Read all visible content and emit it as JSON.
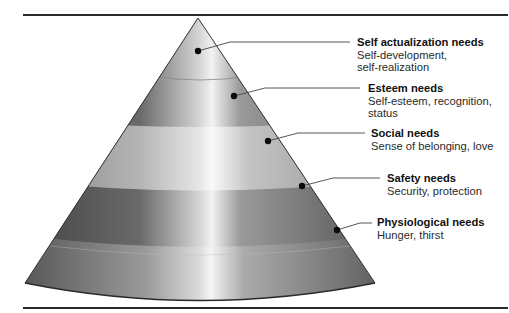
{
  "diagram": {
    "type": "hierarchy-cone",
    "levels": [
      {
        "title": "Self actualization needs",
        "desc_lines": [
          "Self-development,",
          "self-realization"
        ]
      },
      {
        "title": "Esteem needs",
        "desc_lines": [
          "Self-esteem, recognition,",
          "status"
        ]
      },
      {
        "title": "Social needs",
        "desc_lines": [
          "Sense of belonging, love"
        ]
      },
      {
        "title": "Safety needs",
        "desc_lines": [
          "Security, protection"
        ]
      },
      {
        "title": "Physiological needs",
        "desc_lines": [
          "Hunger, thirst"
        ]
      }
    ],
    "colors": {
      "rule": "#2a2a2a",
      "band_dark": "#5a5a5a",
      "band_light": "#b8b8b8",
      "highlight": "#f2f2f2",
      "dot": "#0a0a0a",
      "leader": "#444444"
    }
  }
}
